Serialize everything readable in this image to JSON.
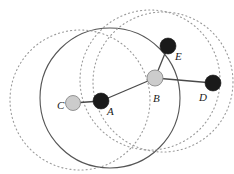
{
  "figure": {
    "type": "geometric-diagram",
    "title": "",
    "width": 234,
    "height": 174,
    "background": "#ffffff"
  },
  "style": {
    "solid_stroke": "#555555",
    "dotted_stroke": "#9a9a9a",
    "edge_stroke": "#4a4a4a",
    "node_black_fill": "#1a1a1a",
    "node_gray_fill": "#cccccc",
    "node_gray_stroke": "#8a8a8a",
    "label_color": "#1a1a1a"
  },
  "nodes": [
    {
      "id": "C",
      "label": "C",
      "cx": 73,
      "cy": 103,
      "r": 7.5,
      "fill": "gray",
      "label_dx": -16,
      "label_dy": 6
    },
    {
      "id": "A",
      "label": "A",
      "cx": 101,
      "cy": 101,
      "r": 8.0,
      "fill": "black",
      "label_dx": 6,
      "label_dy": 14
    },
    {
      "id": "B",
      "label": "B",
      "cx": 155,
      "cy": 78,
      "r": 8.0,
      "fill": "gray",
      "label_dx": -2,
      "label_dy": 24
    },
    {
      "id": "E",
      "label": "E",
      "cx": 168,
      "cy": 46,
      "r": 8.0,
      "fill": "black",
      "label_dx": 7,
      "label_dy": 14
    },
    {
      "id": "D",
      "label": "D",
      "cx": 213,
      "cy": 83,
      "r": 8.0,
      "fill": "black",
      "label_dx": -14,
      "label_dy": 18
    }
  ],
  "edges": [
    {
      "from": "C",
      "to": "A"
    },
    {
      "from": "A",
      "to": "B"
    },
    {
      "from": "B",
      "to": "E"
    },
    {
      "from": "B",
      "to": "D"
    }
  ],
  "circles": [
    {
      "id": "solid-range-A",
      "cx": 110,
      "cy": 98,
      "r": 70,
      "style": "solid"
    },
    {
      "id": "dotted-range-C",
      "cx": 80,
      "cy": 100,
      "r": 70,
      "style": "dotted"
    },
    {
      "id": "dotted-range-B",
      "cx": 150,
      "cy": 80,
      "r": 70,
      "style": "dotted"
    },
    {
      "id": "dotted-range-D",
      "cx": 163,
      "cy": 82,
      "r": 70,
      "style": "dotted"
    }
  ],
  "legend": {
    "black_node_meaning": "filled-node",
    "gray_node_meaning": "shaded-node"
  }
}
